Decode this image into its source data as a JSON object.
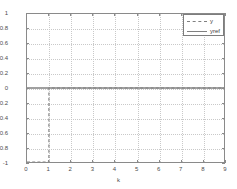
{
  "chart_data": {
    "type": "line",
    "title": "",
    "xlabel": "k",
    "ylabel": "",
    "xlim": [
      0,
      9
    ],
    "ylim": [
      -1,
      1
    ],
    "grid": true,
    "legend_position": "upper-right",
    "xticks": [
      "0",
      "1",
      "2",
      "3",
      "4",
      "5",
      "6",
      "7",
      "8",
      "9"
    ],
    "xtick_values": [
      0,
      1,
      2,
      3,
      4,
      5,
      6,
      7,
      8,
      9
    ],
    "yticks": [
      "1",
      "0.8",
      "0.6",
      "0.4",
      "0.2",
      "0",
      "-0.2",
      "-0.4",
      "-0.6",
      "-0.8",
      "-1"
    ],
    "ytick_values": [
      1,
      0.8,
      0.6,
      0.4,
      0.2,
      0,
      -0.2,
      -0.4,
      -0.6,
      -0.8,
      -1
    ],
    "series": [
      {
        "name": "y",
        "style": "dashed",
        "color": "#808080",
        "drawstyle": "steps-post",
        "x": [
          0,
          1,
          2,
          3,
          4,
          5,
          6,
          7,
          8,
          9
        ],
        "values": [
          -1,
          0,
          0,
          0,
          0,
          0,
          0,
          0,
          0,
          0
        ]
      },
      {
        "name": "yref",
        "style": "solid",
        "color": "#808080",
        "drawstyle": "default",
        "x": [
          0,
          1,
          2,
          3,
          4,
          5,
          6,
          7,
          8,
          9
        ],
        "values": [
          0,
          0,
          0,
          0,
          0,
          0,
          0,
          0,
          0,
          0
        ]
      }
    ]
  },
  "legend": {
    "entries": [
      {
        "label": "y"
      },
      {
        "label": "yref"
      }
    ]
  },
  "axes": {
    "xlabel": "k"
  },
  "colors": {
    "axis": "#8a8a8a",
    "grid": "#c9c9c9",
    "series": "#808080",
    "background": "#ffffff",
    "text": "#4d4d4d"
  }
}
